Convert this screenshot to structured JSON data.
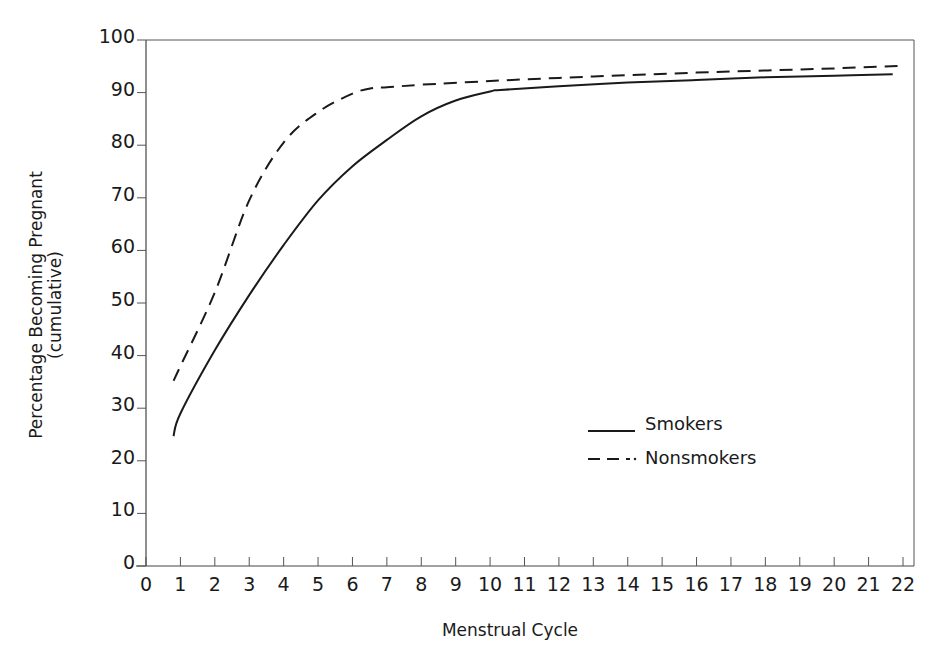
{
  "chart_data": {
    "type": "line",
    "title": "",
    "xlabel": "Menstrual Cycle",
    "ylabel": "Percentage Becoming Pregnant",
    "ylabel_sub": "(cumulative)",
    "xlim": [
      0,
      22
    ],
    "ylim": [
      0,
      100
    ],
    "grid": false,
    "legend_position": "center-right, inside plot",
    "x_ticks": [
      0,
      1,
      2,
      3,
      4,
      5,
      6,
      7,
      8,
      9,
      10,
      11,
      12,
      13,
      14,
      15,
      16,
      17,
      18,
      19,
      20,
      21,
      22
    ],
    "y_ticks": [
      0,
      10,
      20,
      30,
      40,
      50,
      60,
      70,
      80,
      90,
      100
    ],
    "series": [
      {
        "name": "Smokers",
        "style": "solid",
        "color": "#1a1a1a",
        "x": [
          0.8,
          1,
          2,
          3,
          4,
          5,
          6,
          7,
          8,
          9,
          10,
          10.3,
          12,
          14,
          16,
          18,
          20,
          21.7
        ],
        "y": [
          24.7,
          29,
          41,
          51.5,
          61,
          69.5,
          76,
          81,
          85.5,
          88.5,
          90.2,
          90.5,
          91.2,
          91.9,
          92.4,
          92.9,
          93.2,
          93.5
        ]
      },
      {
        "name": "Nonsmokers",
        "style": "dashed",
        "color": "#1a1a1a",
        "x": [
          0.8,
          1,
          2,
          3,
          4,
          5,
          6,
          6.6,
          7,
          8,
          10,
          12,
          14,
          16,
          18,
          20,
          22
        ],
        "y": [
          35.2,
          38,
          52,
          69.5,
          80.5,
          86.3,
          89.8,
          90.9,
          91,
          91.5,
          92.2,
          92.8,
          93.3,
          93.8,
          94.2,
          94.6,
          95.1
        ]
      }
    ]
  },
  "labels": {
    "x_axis": "Menstrual Cycle",
    "y_axis_line1": "Percentage Becoming Pregnant",
    "y_axis_line2": "(cumulative)",
    "legend_smokers": "Smokers",
    "legend_nonsmokers": "Nonsmokers"
  }
}
